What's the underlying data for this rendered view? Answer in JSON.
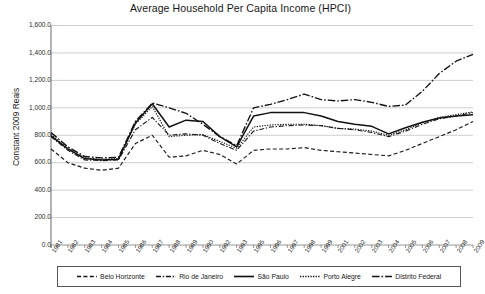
{
  "chart_data": {
    "type": "line",
    "title": "Average Household Per Capita Income (HPCI)",
    "xlabel": "",
    "ylabel": "Constant 2009 Reais",
    "ylim": [
      0,
      1600
    ],
    "ytick_labels": [
      "1,600.0",
      "1,400.0",
      "1,200.0",
      "1,000.0",
      "800.0",
      "600.0",
      "400.0",
      "200.0",
      "0.0"
    ],
    "ytick_values": [
      1600,
      1400,
      1200,
      1000,
      800,
      600,
      400,
      200,
      0
    ],
    "grid": true,
    "legend_position": "bottom",
    "categories": [
      "1981",
      "1982",
      "1983",
      "1984",
      "1985",
      "1986",
      "1987",
      "1988",
      "1989",
      "1990",
      "1992",
      "1993",
      "1995",
      "1996",
      "1997",
      "1998",
      "1999",
      "2001",
      "2002",
      "2003",
      "2004",
      "2005",
      "2006",
      "2007",
      "2008",
      "2009"
    ],
    "series": [
      {
        "name": "Belo Horizonte",
        "style": "dashed",
        "color": "#1a1a1a",
        "values": [
          700,
          600,
          560,
          545,
          560,
          740,
          800,
          640,
          650,
          690,
          660,
          590,
          690,
          700,
          700,
          710,
          690,
          680,
          670,
          660,
          650,
          690,
          740,
          790,
          840,
          900
        ]
      },
      {
        "name": "Rio de Janeiro",
        "style": "dashdot",
        "color": "#1a1a1a",
        "values": [
          790,
          690,
          620,
          615,
          620,
          840,
          930,
          800,
          810,
          800,
          740,
          690,
          830,
          860,
          870,
          875,
          870,
          850,
          840,
          820,
          790,
          830,
          880,
          920,
          940,
          965
        ]
      },
      {
        "name": "São Paulo",
        "style": "solid",
        "color": "#111111",
        "values": [
          795,
          700,
          630,
          620,
          625,
          890,
          1030,
          860,
          910,
          900,
          790,
          715,
          940,
          965,
          965,
          965,
          940,
          900,
          880,
          865,
          810,
          855,
          895,
          925,
          940,
          950
        ]
      },
      {
        "name": "Porto Alegre",
        "style": "dotted",
        "color": "#1a1a1a",
        "values": [
          805,
          705,
          635,
          625,
          630,
          880,
          1010,
          790,
          800,
          805,
          755,
          705,
          860,
          875,
          880,
          880,
          870,
          850,
          845,
          830,
          800,
          840,
          890,
          930,
          950,
          970
        ]
      },
      {
        "name": "Distrito Federal",
        "style": "longdashdot",
        "color": "#111111",
        "values": [
          820,
          715,
          645,
          635,
          640,
          900,
          1035,
          1000,
          960,
          880,
          790,
          725,
          1000,
          1025,
          1060,
          1100,
          1060,
          1050,
          1060,
          1040,
          1010,
          1020,
          1120,
          1250,
          1340,
          1390
        ]
      }
    ]
  },
  "legend": {
    "items": [
      {
        "label": "Belo Horizonte",
        "style": "dashed"
      },
      {
        "label": "Rio de Janeiro",
        "style": "dashdot"
      },
      {
        "label": "São Paulo",
        "style": "solid"
      },
      {
        "label": "Porto Alegre",
        "style": "dotted"
      },
      {
        "label": "Distrito Federal",
        "style": "longdashdot"
      }
    ]
  }
}
